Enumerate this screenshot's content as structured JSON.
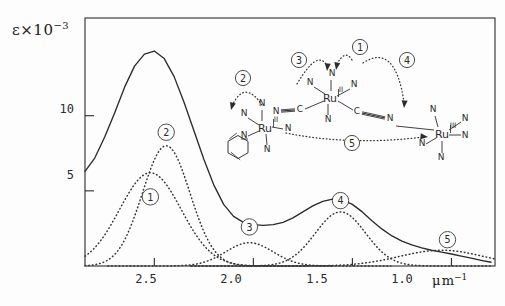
{
  "figure": {
    "kind": "absorption-spectrum-with-molecular-inset",
    "background": "#fdfdfd",
    "ink": "#2b2b2b"
  },
  "axis": {
    "y_label_symbol": "ε",
    "y_label_factor": "×10",
    "y_label_exponent": "−3",
    "y_ticks": [
      "10",
      "5"
    ],
    "x_ticks": [
      "2.5",
      "2.0",
      "1.5",
      "1.0"
    ],
    "x_unit_mu": "μ",
    "x_unit_m": "m",
    "x_unit_exp": "−1"
  },
  "chart_data": {
    "type": "line",
    "title": "",
    "xlabel": "μ m⁻¹",
    "ylabel": "ε ×10⁻³",
    "xlim": [
      2.85,
      0.78
    ],
    "ylim": [
      0,
      16.5
    ],
    "x_reversed": true,
    "grid": false,
    "legend": "inline-circled-numbers",
    "x_tick_values": [
      2.5,
      2.0,
      1.5,
      1.0
    ],
    "y_tick_values": [
      5,
      10
    ],
    "series": [
      {
        "name": "total",
        "style": "solid",
        "label": "",
        "description": "sum envelope of all component bands",
        "points_x": [
          2.85,
          2.8,
          2.75,
          2.7,
          2.65,
          2.6,
          2.55,
          2.5,
          2.45,
          2.4,
          2.35,
          2.3,
          2.25,
          2.2,
          2.15,
          2.1,
          2.05,
          2.0,
          1.95,
          1.9,
          1.85,
          1.8,
          1.75,
          1.7,
          1.65,
          1.6,
          1.55,
          1.5,
          1.45,
          1.4,
          1.35,
          1.3,
          1.25,
          1.2,
          1.15,
          1.1,
          1.05,
          1.0,
          0.95,
          0.9,
          0.85,
          0.8
        ],
        "points_y": [
          6.3,
          7.2,
          8.6,
          10.2,
          11.9,
          13.3,
          14.1,
          14.3,
          13.8,
          12.6,
          10.9,
          9.0,
          7.1,
          5.4,
          4.1,
          3.3,
          2.9,
          2.75,
          2.7,
          2.75,
          2.9,
          3.2,
          3.6,
          4.0,
          4.3,
          4.45,
          4.4,
          4.1,
          3.6,
          3.0,
          2.45,
          2.0,
          1.65,
          1.4,
          1.2,
          1.05,
          0.92,
          0.8,
          0.66,
          0.52,
          0.38,
          0.25
        ]
      },
      {
        "name": "band-1",
        "style": "dotted",
        "label": "1",
        "center": 2.52,
        "amplitude": 6.2,
        "width": 0.22,
        "label_xy": [
          2.52,
          4.6
        ]
      },
      {
        "name": "band-2",
        "style": "dotted",
        "label": "2",
        "center": 2.44,
        "amplitude": 8.0,
        "width": 0.17,
        "label_xy": [
          2.44,
          8.9
        ]
      },
      {
        "name": "band-3",
        "style": "dotted",
        "label": "3",
        "center": 2.02,
        "amplitude": 1.55,
        "width": 0.17,
        "label_xy": [
          2.02,
          2.6
        ]
      },
      {
        "name": "band-4",
        "style": "dotted",
        "label": "4",
        "center": 1.56,
        "amplitude": 3.6,
        "width": 0.18,
        "label_xy": [
          1.56,
          4.35
        ]
      },
      {
        "name": "band-5",
        "style": "dotted",
        "label": "5",
        "center": 1.05,
        "amplitude": 1.05,
        "width": 0.3,
        "label_xy": [
          1.02,
          1.75
        ]
      }
    ]
  },
  "inset": {
    "name": "trinuclear-ruthenium-complex",
    "metals": [
      {
        "id": "ru-left",
        "symbol": "Ru",
        "oxidation": "II"
      },
      {
        "id": "ru-center",
        "symbol": "Ru",
        "oxidation": "II"
      },
      {
        "id": "ru-right",
        "symbol": "Ru",
        "oxidation": "III"
      }
    ],
    "atom_label_n": "N",
    "atom_label_c": "C",
    "transition_markers": [
      "1",
      "2",
      "3",
      "4",
      "5"
    ],
    "ring": "pyridine"
  }
}
